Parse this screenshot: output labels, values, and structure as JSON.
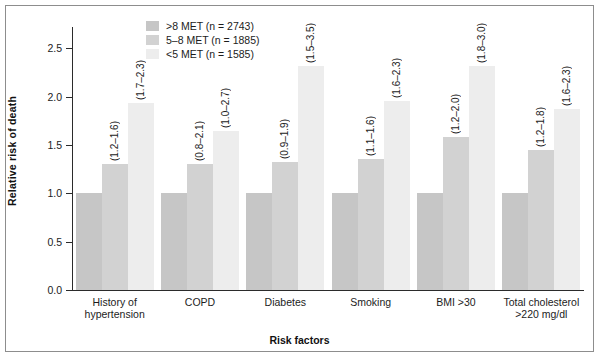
{
  "chart_data": {
    "type": "bar",
    "title": "",
    "xlabel": "Risk factors",
    "ylabel": "Relative risk of death",
    "ylim": [
      0.0,
      2.5
    ],
    "yticks": [
      "0.0",
      "0.5",
      "1.0",
      "1.5",
      "2.0",
      "2.5"
    ],
    "grid": false,
    "legend_position": "top-center",
    "categories": [
      "History of hypertension",
      "COPD",
      "Diabetes",
      "Smoking",
      "BMI >30",
      "Total cholesterol >220 mg/dl"
    ],
    "series": [
      {
        "name": ">8 MET (n = 2743)",
        "color": "#c6c6c6",
        "values": [
          1.0,
          1.0,
          1.0,
          1.0,
          1.0,
          1.0
        ],
        "ci_labels": [
          "",
          "",
          "",
          "",
          "",
          ""
        ]
      },
      {
        "name": "5–8 MET (n = 1885)",
        "color": "#d2d2d2",
        "values": [
          1.3,
          1.3,
          1.32,
          1.35,
          1.58,
          1.45
        ],
        "ci_labels": [
          "(1.2–1.6)",
          "(0.8–2.1)",
          "(0.9–1.9)",
          "(1.1–1.6)",
          "(1.2–2.0)",
          "(1.2–1.8)"
        ]
      },
      {
        "name": "<5 MET (n = 1585)",
        "color": "#ededed",
        "values": [
          1.93,
          1.64,
          2.32,
          1.95,
          2.32,
          1.87
        ],
        "ci_labels": [
          "(1.7–2.3)",
          "(1.0–2.7)",
          "(1.5–3.5)",
          "(1.6–2.3)",
          "(1.8–3.0)",
          "(1.6–2.3)"
        ]
      }
    ]
  },
  "legend": {
    "items": [
      {
        "label": ">8 MET (n = 2743)",
        "color": "#c6c6c6"
      },
      {
        "label": "5–8 MET (n = 1885)",
        "color": "#d2d2d2"
      },
      {
        "label": "<5 MET (n = 1585)",
        "color": "#ededed"
      }
    ]
  },
  "axes": {
    "y_label": "Relative risk of death",
    "x_label": "Risk factors",
    "y_ticks": [
      "2.5",
      "2.0",
      "1.5",
      "1.0",
      "0.5",
      "0.0"
    ]
  },
  "category_labels": [
    {
      "line1": "History of",
      "line2": "hypertension"
    },
    {
      "line1": "COPD",
      "line2": ""
    },
    {
      "line1": "Diabetes",
      "line2": ""
    },
    {
      "line1": "Smoking",
      "line2": ""
    },
    {
      "line1": "BMI >30",
      "line2": ""
    },
    {
      "line1": "Total cholesterol",
      "line2": ">220 mg/dl"
    }
  ]
}
